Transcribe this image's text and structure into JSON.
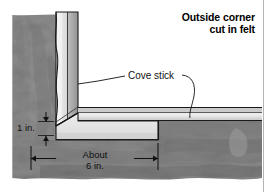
{
  "figure": {
    "title_lines": [
      "Outside corner",
      "cut in felt"
    ],
    "labels": {
      "cove_stick": "Cove stick",
      "dim_vertical": "1 in.",
      "dim_horizontal_line1": "About",
      "dim_horizontal_line2": "6 in."
    },
    "colors": {
      "felt_light": "#9a9a9a",
      "felt_mid": "#8a8a8a",
      "felt_dark": "#6e6e6e",
      "cove_face": "#e9e9e9",
      "cove_shade": "#c9c9c9",
      "outline": "#1a1a1a",
      "page_rule": "#b4b4b4",
      "background": "#ffffff"
    }
  }
}
